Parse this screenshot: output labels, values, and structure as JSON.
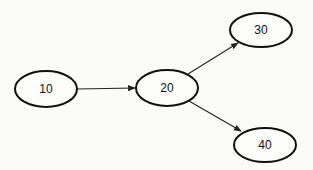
{
  "diagram": {
    "type": "directed-graph",
    "nodes": [
      {
        "id": "n10",
        "label": "10",
        "cx": 46,
        "cy": 89,
        "rx": 31,
        "ry": 18
      },
      {
        "id": "n20",
        "label": "20",
        "cx": 167,
        "cy": 88,
        "rx": 31,
        "ry": 18
      },
      {
        "id": "n30",
        "label": "30",
        "cx": 261,
        "cy": 30,
        "rx": 31,
        "ry": 17
      },
      {
        "id": "n40",
        "label": "40",
        "cx": 265,
        "cy": 145,
        "rx": 31,
        "ry": 17
      }
    ],
    "edges": [
      {
        "from": "10",
        "to": "20"
      },
      {
        "from": "20",
        "to": "30"
      },
      {
        "from": "20",
        "to": "40"
      }
    ]
  }
}
